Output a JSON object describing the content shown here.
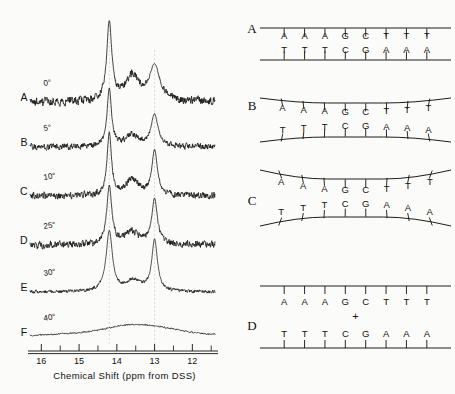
{
  "figure": {
    "ink_color": "#111111",
    "background_color": "#fbfbf9"
  },
  "nmr": {
    "axis": {
      "caption": "Chemical Shift  (ppm from DSS)",
      "tick_labels": [
        "16",
        "15",
        "14",
        "13",
        "12"
      ],
      "tick_values": [
        16,
        15,
        14,
        13,
        12
      ],
      "minor_tick_values": [
        15.5,
        14.5,
        13.5,
        12.5,
        11.5
      ],
      "range_left_ppm": 16.3,
      "range_right_ppm": 11.4,
      "direction": "descending"
    },
    "guide_lines_ppm": [
      14.2,
      13.0
    ],
    "traces": [
      {
        "label": "A",
        "temperature": "0°"
      },
      {
        "label": "B",
        "temperature": "5°"
      },
      {
        "label": "C",
        "temperature": "10°"
      },
      {
        "label": "D",
        "temperature": "25°"
      },
      {
        "label": "E",
        "temperature": "30°"
      },
      {
        "label": "F",
        "temperature": "40°"
      }
    ]
  },
  "chart_data": {
    "type": "line",
    "xlabel": "Chemical Shift  (ppm from DSS)",
    "ylabel": "",
    "xlim": [
      16.3,
      11.4
    ],
    "x_inverted": true,
    "grid": false,
    "legend": "none",
    "tick_labels": [
      "16",
      "15",
      "14",
      "13",
      "12"
    ],
    "annotations": [
      "0°",
      "5°",
      "10°",
      "25°",
      "30°",
      "40°"
    ],
    "series": [
      {
        "name": "A",
        "label": "0°",
        "temperature_c": 0,
        "peaks_ppm": [
          14.2,
          13.6,
          13.0
        ],
        "peak_heights": [
          1.0,
          0.32,
          0.45
        ],
        "peak_widths_ppm": [
          0.08,
          0.22,
          0.17
        ],
        "noise": 0.075,
        "baseline": 0.0
      },
      {
        "name": "B",
        "label": "5°",
        "temperature_c": 5,
        "peaks_ppm": [
          14.2,
          13.6,
          13.0
        ],
        "peak_heights": [
          1.0,
          0.2,
          0.55
        ],
        "peak_widths_ppm": [
          0.07,
          0.2,
          0.11
        ],
        "noise": 0.07,
        "baseline": 0.0
      },
      {
        "name": "C",
        "label": "10°",
        "temperature_c": 10,
        "peaks_ppm": [
          14.2,
          13.6,
          13.0
        ],
        "peak_heights": [
          1.0,
          0.26,
          0.72
        ],
        "peak_widths_ppm": [
          0.07,
          0.2,
          0.09
        ],
        "noise": 0.075,
        "baseline": 0.0
      },
      {
        "name": "D",
        "label": "25°",
        "temperature_c": 25,
        "peaks_ppm": [
          14.2,
          13.6,
          13.0
        ],
        "peak_heights": [
          1.0,
          0.22,
          0.78
        ],
        "peak_widths_ppm": [
          0.08,
          0.22,
          0.09
        ],
        "noise": 0.085,
        "baseline": 0.0
      },
      {
        "name": "E",
        "label": "30°",
        "temperature_c": 30,
        "peaks_ppm": [
          14.2,
          13.55,
          13.0
        ],
        "peak_heights": [
          1.0,
          0.18,
          0.85
        ],
        "peak_widths_ppm": [
          0.1,
          0.25,
          0.09
        ],
        "noise": 0.04,
        "baseline": 0.0
      },
      {
        "name": "F",
        "label": "40°",
        "temperature_c": 40,
        "peaks_ppm": [
          13.6
        ],
        "peak_heights": [
          0.3
        ],
        "peak_widths_ppm": [
          1.3
        ],
        "noise": 0.035,
        "baseline": 0.0
      }
    ]
  },
  "dna": {
    "top_strand": [
      "A",
      "A",
      "A",
      "G",
      "C",
      "T",
      "T",
      "T"
    ],
    "bottom_strand": [
      "T",
      "T",
      "T",
      "C",
      "G",
      "A",
      "A",
      "A"
    ],
    "plus_symbol": "+",
    "panels": [
      {
        "label": "A",
        "state": "fully base-paired duplex",
        "top_strand": [
          "A",
          "A",
          "A",
          "G",
          "C",
          "T",
          "T",
          "T"
        ],
        "bottom_strand": [
          "T",
          "T",
          "T",
          "C",
          "G",
          "A",
          "A",
          "A"
        ],
        "frayed_ends": 0,
        "separated": false,
        "plus": false
      },
      {
        "label": "B",
        "state": "duplex with slight end fraying",
        "top_strand": [
          "A",
          "A",
          "A",
          "G",
          "C",
          "T",
          "T",
          "T"
        ],
        "bottom_strand": [
          "T",
          "T",
          "T",
          "C",
          "G",
          "A",
          "A",
          "A"
        ],
        "frayed_ends": 1,
        "separated": false,
        "plus": false
      },
      {
        "label": "C",
        "state": "duplex with greater end fraying",
        "top_strand": [
          "A",
          "A",
          "A",
          "G",
          "C",
          "T",
          "T",
          "T"
        ],
        "bottom_strand": [
          "T",
          "T",
          "T",
          "C",
          "G",
          "A",
          "A",
          "A"
        ],
        "frayed_ends": 2,
        "separated": false,
        "plus": false
      },
      {
        "label": "D",
        "state": "fully dissociated single strands",
        "top_strand": [
          "A",
          "A",
          "A",
          "G",
          "C",
          "T",
          "T",
          "T"
        ],
        "bottom_strand": [
          "T",
          "T",
          "T",
          "C",
          "G",
          "A",
          "A",
          "A"
        ],
        "frayed_ends": 8,
        "separated": true,
        "plus": true
      }
    ]
  }
}
